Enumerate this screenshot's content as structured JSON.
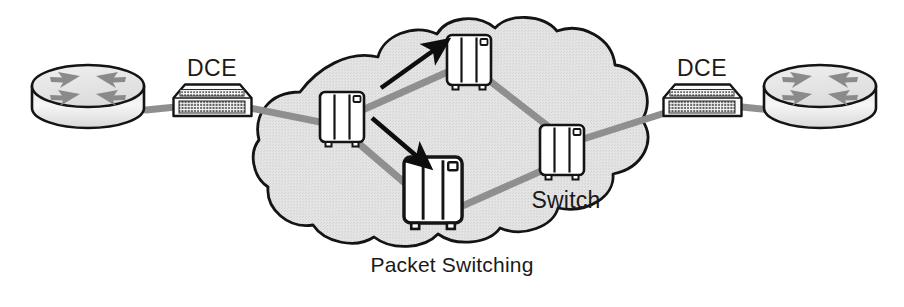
{
  "diagram": {
    "title": "Packet Switching",
    "cloud_label": "Packet Switching",
    "switch_label": "Switch",
    "dce_left_label": "DCE",
    "dce_right_label": "DCE",
    "colors": {
      "background": "#ffffff",
      "cloud_fill": "#e2e2e2",
      "cloud_stroke": "#1a1a1a",
      "link_line": "#8f8f8f",
      "device_fill": "#ffffff",
      "device_stroke": "#1a1a1a",
      "router_top_fill": "#e8e8e8",
      "router_body_fill": "#f2f2f2",
      "router_arrow_fill": "#8a8a8a",
      "dce_grid": "#4a4a4a",
      "arrow_black": "#0d0d0d",
      "text": "#1a1a1a"
    },
    "nodes": [
      {
        "id": "router-left",
        "type": "router",
        "label": "",
        "x": 88,
        "y": 99
      },
      {
        "id": "dce-left",
        "type": "dce",
        "label": "DCE",
        "x": 212,
        "y": 100
      },
      {
        "id": "switch-west",
        "type": "switch",
        "label": "",
        "x": 342,
        "y": 117
      },
      {
        "id": "switch-north",
        "type": "switch",
        "label": "",
        "x": 469,
        "y": 60
      },
      {
        "id": "switch-south",
        "type": "switch",
        "label": "",
        "x": 435,
        "y": 193
      },
      {
        "id": "switch-east",
        "type": "switch",
        "label": "Switch",
        "x": 562,
        "y": 150
      },
      {
        "id": "dce-right",
        "type": "dce",
        "label": "DCE",
        "x": 702,
        "y": 100
      },
      {
        "id": "router-right",
        "type": "router",
        "label": "",
        "x": 820,
        "y": 99
      }
    ],
    "links": [
      {
        "from": "router-left",
        "to": "dce-left"
      },
      {
        "from": "dce-left",
        "to": "switch-west"
      },
      {
        "from": "switch-west",
        "to": "switch-north"
      },
      {
        "from": "switch-north",
        "to": "switch-east"
      },
      {
        "from": "switch-west",
        "to": "switch-south"
      },
      {
        "from": "switch-south",
        "to": "switch-east"
      },
      {
        "from": "switch-east",
        "to": "dce-right"
      },
      {
        "from": "dce-right",
        "to": "router-right"
      }
    ],
    "flow_arrows": [
      {
        "id": "arrow-up-right",
        "direction": "up-right",
        "from_x": 381,
        "from_y": 88,
        "to_x": 442,
        "to_y": 45
      },
      {
        "id": "arrow-down-right",
        "direction": "down-right",
        "from_x": 372,
        "from_y": 118,
        "to_x": 425,
        "to_y": 163
      }
    ]
  }
}
